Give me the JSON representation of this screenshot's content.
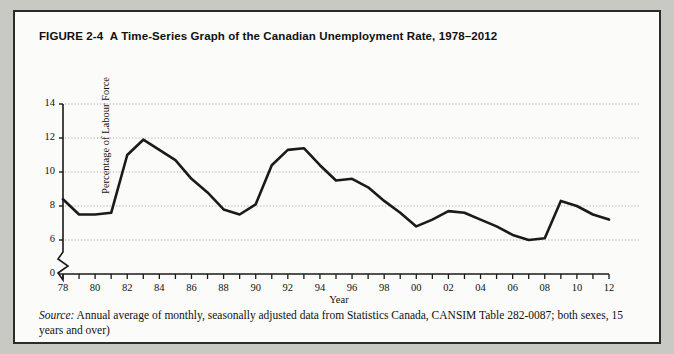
{
  "figure": {
    "number": "FIGURE 2-4",
    "title": "A Time-Series Graph of the Canadian Unemployment Rate, 1978–2012",
    "source_word": "Source:",
    "source_text": " Annual average of monthly, seasonally adjusted data from Statistics Canada, CANSIM Table 282-0087; both sexes, 15 years and over)"
  },
  "colors": {
    "frame": "#2b2b2b",
    "page_background": "#c9c9c4",
    "figure_background": "#fbfbf9",
    "line": "#1a1a1a",
    "gridline": "#9a9a9a",
    "axis": "#1a1a1a",
    "text": "#111111"
  },
  "chart_data": {
    "type": "line",
    "title": "A Time-Series Graph of the Canadian Unemployment Rate, 1978–2012",
    "xlabel": "Year",
    "ylabel": "Percentage of Labour Force",
    "xlim": [
      1978,
      2012
    ],
    "ylim": [
      6,
      14
    ],
    "y_axis_break": true,
    "y_axis_break_from": 0,
    "y_axis_break_to": 6,
    "grid": true,
    "grid_axis": "y",
    "legend": "none",
    "ytick_values": [
      0,
      6,
      8,
      10,
      12,
      14
    ],
    "ytick_labels": [
      "0",
      "6",
      "8",
      "10",
      "12",
      "14"
    ],
    "xtick_values": [
      1978,
      1980,
      1982,
      1984,
      1986,
      1988,
      1990,
      1992,
      1994,
      1996,
      1998,
      2000,
      2002,
      2004,
      2006,
      2008,
      2010,
      2012
    ],
    "xtick_labels": [
      "78",
      "80",
      "82",
      "84",
      "86",
      "88",
      "90",
      "92",
      "94",
      "96",
      "98",
      "00",
      "02",
      "04",
      "06",
      "08",
      "10",
      "12"
    ],
    "x": [
      1978,
      1979,
      1980,
      1981,
      1982,
      1983,
      1984,
      1985,
      1986,
      1987,
      1988,
      1989,
      1990,
      1991,
      1992,
      1993,
      1994,
      1995,
      1996,
      1997,
      1998,
      1999,
      2000,
      2001,
      2002,
      2003,
      2004,
      2005,
      2006,
      2007,
      2008,
      2009,
      2010,
      2011,
      2012
    ],
    "values": [
      8.4,
      7.5,
      7.5,
      7.6,
      11.0,
      11.9,
      11.3,
      10.7,
      9.6,
      8.8,
      7.8,
      7.5,
      8.1,
      10.4,
      11.3,
      11.4,
      10.4,
      9.5,
      9.6,
      9.1,
      8.3,
      7.6,
      6.8,
      7.2,
      7.7,
      7.6,
      7.2,
      6.8,
      6.3,
      6.0,
      6.1,
      8.3,
      8.0,
      7.5,
      7.2
    ]
  }
}
